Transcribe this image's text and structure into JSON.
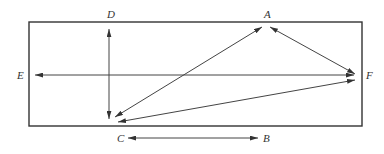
{
  "diagram": {
    "type": "vector-arrow-diagram",
    "frame": {
      "x": 29,
      "y": 22,
      "width": 333,
      "height": 104,
      "stroke": "#333333"
    },
    "line_color": "#444444",
    "points": {
      "A": {
        "label": "A",
        "x": 266,
        "y": 27,
        "label_x": 264,
        "label_y": 18
      },
      "B": {
        "label": "B",
        "x": 258,
        "y": 138,
        "label_x": 263,
        "label_y": 142
      },
      "C": {
        "label": "C",
        "x": 128,
        "y": 138,
        "label_x": 117,
        "label_y": 142
      },
      "D": {
        "label": "D",
        "x": 109,
        "y": 29,
        "label_x": 107,
        "label_y": 18
      },
      "E": {
        "label": "E",
        "x": 35,
        "y": 75,
        "label_x": 17,
        "label_y": 79
      },
      "F": {
        "label": "F",
        "x": 355,
        "y": 75,
        "label_x": 366,
        "label_y": 79
      }
    },
    "arrows": [
      {
        "id": "D-vertical",
        "from": [
          109,
          119
        ],
        "to": [
          109,
          29
        ],
        "double": true
      },
      {
        "id": "E-F",
        "from": [
          354,
          75
        ],
        "to": [
          35,
          75
        ],
        "double": true
      },
      {
        "id": "C-B",
        "from": [
          258,
          138
        ],
        "to": [
          128,
          138
        ],
        "double": true
      },
      {
        "id": "A-C",
        "from": [
          262,
          27
        ],
        "to": [
          115,
          117
        ],
        "double": true
      },
      {
        "id": "A-F",
        "from": [
          270,
          27
        ],
        "to": [
          355,
          74
        ],
        "double": true
      },
      {
        "id": "F-C",
        "from": [
          355,
          80
        ],
        "to": [
          118,
          122
        ],
        "double": true
      }
    ]
  }
}
